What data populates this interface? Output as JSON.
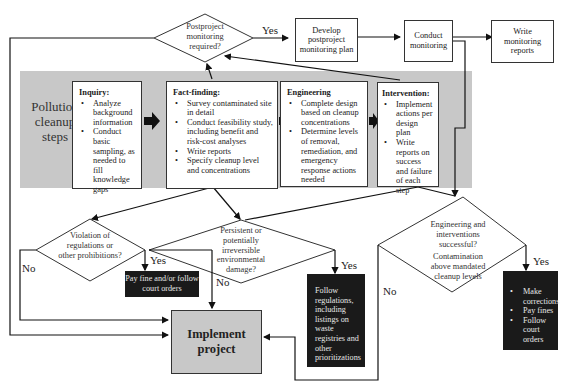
{
  "diagram": {
    "side_label": "Pollution cleanup steps",
    "decisions": {
      "postproject": "Postproject monitoring required?",
      "violation": "Violation of regulations or other prohibitions?",
      "persistent": "Persistent or potentially irreversible environmental damage?",
      "engineering_q1": "Engineering and interventions successful?",
      "engineering_q2": "Contamination above mandated cleanup levels"
    },
    "top_boxes": {
      "develop_plan": "Develop postproject monitoring plan",
      "conduct_monitoring": "Conduct monitoring",
      "write_reports": "Write monitoring reports"
    },
    "steps": [
      {
        "title": "Inquiry:",
        "items": [
          "Analyze background information",
          "Conduct basic sampling, as needed to fill knowledge gaps"
        ]
      },
      {
        "title": "Fact-finding:",
        "items": [
          "Survey contaminated site in detail",
          "Conduct feasibility study, including benefit and risk-cost analyses",
          "Write reports",
          "Specify cleanup level and concentrations"
        ]
      },
      {
        "title": "Engineering",
        "items": [
          "Complete design based on cleanup concentrations",
          "Determine levels of removal, remediation, and emergency response actions needed"
        ]
      },
      {
        "title": "Intervention:",
        "items": [
          "Implement actions per design plan",
          "Write reports on success and failure of each step"
        ]
      }
    ],
    "outcomes": {
      "pay_fine": "Pay fine and/or follow court orders",
      "follow_regulations": "Follow regulations, including listings on waste registries and other prioritizations",
      "corrections": [
        "Make corrections",
        "Pay fines",
        "Follow court orders"
      ],
      "implement": "Implement project"
    },
    "edge_labels": {
      "yes_top": "Yes",
      "yes_violation": "Yes",
      "no_violation": "No",
      "yes_persistent": "Yes",
      "no_persistent": "No",
      "yes_engineering": "Yes",
      "no_engineering": "No"
    }
  }
}
